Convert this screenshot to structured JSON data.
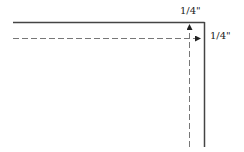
{
  "diagram": {
    "labels": {
      "top_margin": "1/4\"",
      "side_margin": "1/4\""
    },
    "colors": {
      "solid_line": "#444444",
      "dashed_line": "#777777",
      "arrow": "#222222"
    }
  }
}
